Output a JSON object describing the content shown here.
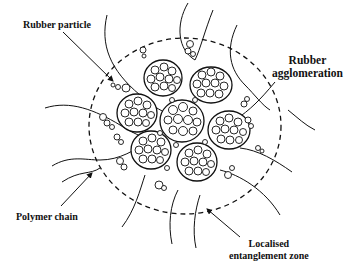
{
  "figure": {
    "type": "schematic",
    "colors": {
      "ink": "#111111",
      "background": "#ffffff"
    }
  },
  "labels": {
    "rubber_particle": "Rubber particle",
    "rubber_agglomeration": {
      "line1": "Rubber",
      "line2": "agglomeration"
    },
    "polymer_chain": "Polymer chain",
    "localised_entanglement_zone": {
      "line1": "Localised",
      "line2": "entanglement zone"
    }
  },
  "elements": {
    "boundary": "dashed circle (localised entanglement zone)",
    "agglomerates_count": 7,
    "arrows": [
      "rubber-particle-arrow",
      "polymer-chain-arrow",
      "entanglement-zone-arrow"
    ]
  }
}
